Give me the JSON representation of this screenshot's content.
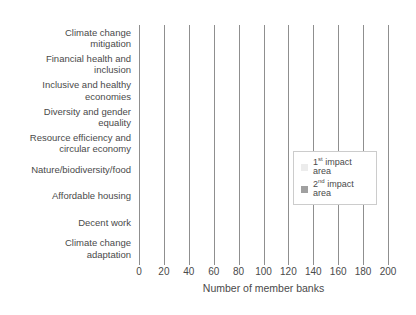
{
  "colors": {
    "first_impact": "#ececec",
    "second_impact": "#a0a0a0",
    "gridline": "#8f8f8f",
    "text": "#4a4a4a",
    "legend_border": "#cccccc",
    "background": "#ffffff"
  },
  "chart_data": {
    "type": "bar",
    "orientation": "horizontal",
    "stacked": true,
    "title": "",
    "categories": [
      "Climate change mitigation",
      "Financial health and inclusion",
      "Inclusive and healthy economies",
      "Diversity and gender equality",
      "Resource efficiency and circular economy",
      "Nature/biodiversity/food",
      "Affordable housing",
      "Decent work",
      "Climate change adaptation"
    ],
    "display_labels": [
      "Climate change\nmitigation",
      "Financial health and\ninclusion",
      "Inclusive and healthy\neconomies",
      "Diversity and gender\nequality",
      "Resource efficiency and\ncircular economy",
      "Nature/biodiversity/food",
      "Affordable housing",
      "Decent work",
      "Climate change\nadaptation"
    ],
    "series": [
      {
        "name": "1st impact area",
        "values": [
          201,
          6,
          6,
          2,
          1,
          1,
          1,
          0,
          1
        ]
      },
      {
        "name": "2nd impact area",
        "values": [
          0,
          70,
          29,
          16,
          16,
          13,
          8,
          8,
          2
        ]
      }
    ],
    "xlabel": "Number of member banks",
    "xlim": [
      0,
      200
    ],
    "xticks": [
      0,
      20,
      40,
      60,
      80,
      100,
      120,
      140,
      160,
      180,
      200
    ],
    "grid": "vertical",
    "legend_position": "middle-right"
  },
  "legend": {
    "entries": [
      {
        "base": "1",
        "sup": "st",
        "rest": " impact area",
        "swatch": "first_impact"
      },
      {
        "base": "2",
        "sup": "nd",
        "rest": " impact area",
        "swatch": "second_impact"
      }
    ]
  }
}
